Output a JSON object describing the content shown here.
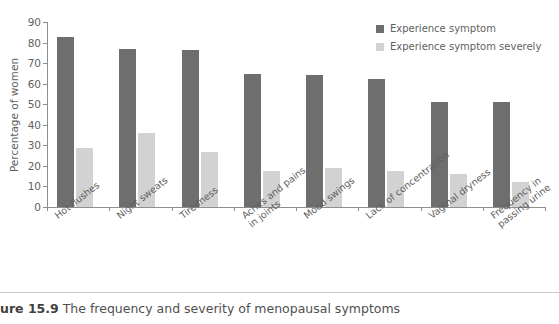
{
  "caption": {
    "figure_number": "ure 15.9",
    "text": "The frequency and severity of menopausal symptoms"
  },
  "legend": {
    "position": "top-right",
    "items": [
      {
        "label": "Experience symptom",
        "color": "#6e6e6e"
      },
      {
        "label": "Experience symptom severely",
        "color": "#d2d2d2"
      }
    ]
  },
  "axes": {
    "ylabel": "Percentage of women",
    "yticks": [
      "0",
      "10",
      "20",
      "30",
      "40",
      "50",
      "60",
      "70",
      "80",
      "90"
    ]
  },
  "chart_data": {
    "type": "bar",
    "title": "The frequency and severity of menopausal symptoms",
    "xlabel": "",
    "ylabel": "Percentage of women",
    "ylim": [
      0,
      90
    ],
    "ytick_step": 10,
    "grid": false,
    "legend_position": "top-right",
    "categories": [
      "Hot flushes",
      "Night sweats",
      "Tiredness",
      "Aches and pains\nin joints",
      "Mood swings",
      "Lack of concentration",
      "Vaginal dryness",
      "Frequency in\npassing urine"
    ],
    "series": [
      {
        "name": "Experience symptom",
        "color": "#6e6e6e",
        "values": [
          82.5,
          77,
          76.5,
          64.5,
          64,
          62.5,
          51,
          51
        ]
      },
      {
        "name": "Experience symptom severely",
        "color": "#d2d2d2",
        "values": [
          28.5,
          36,
          27,
          17.5,
          19,
          17.5,
          16,
          12
        ]
      }
    ]
  }
}
